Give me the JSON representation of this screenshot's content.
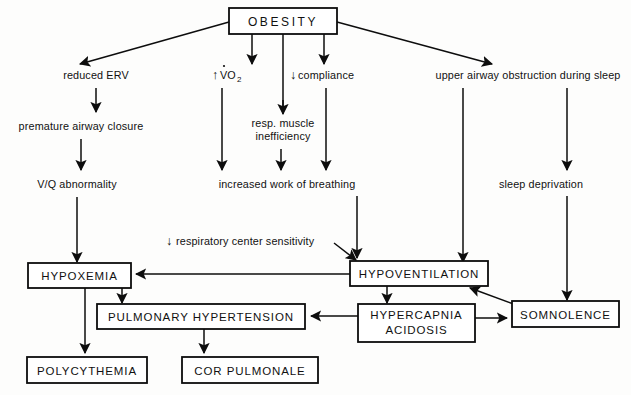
{
  "diagram": {
    "colors": {
      "stroke": "#0d0d0d",
      "background": "#fdfdfc",
      "text": "#111111"
    },
    "nodes": {
      "obesity": "OBESITY",
      "reduced_erv": "reduced ERV",
      "premature_airway_closure": "premature airway closure",
      "vq_abnormality": "V/Q abnormality",
      "vo2_arrow": "↑",
      "vo2_label": "VO",
      "vo2_sub": "2",
      "compliance_arrow": "↓",
      "compliance_label": "compliance",
      "resp_muscle_line1": "resp. muscle",
      "resp_muscle_line2": "inefficiency",
      "increased_work": "increased work of breathing",
      "upper_airway": "upper airway obstruction during sleep",
      "sleep_deprivation": "sleep deprivation",
      "resp_center_arrow": "↓",
      "resp_center_label": "respiratory center sensitivity",
      "hypoxemia": "HYPOXEMIA",
      "hypoventilation": "HYPOVENTILATION",
      "pulmonary_hypertension": "PULMONARY HYPERTENSION",
      "hypercapnia_line1": "HYPERCAPNIA",
      "hypercapnia_line2": "ACIDOSIS",
      "somnolence": "SOMNOLENCE",
      "polycythemia": "POLYCYTHEMIA",
      "cor_pulmonale": "COR PULMONALE"
    }
  }
}
